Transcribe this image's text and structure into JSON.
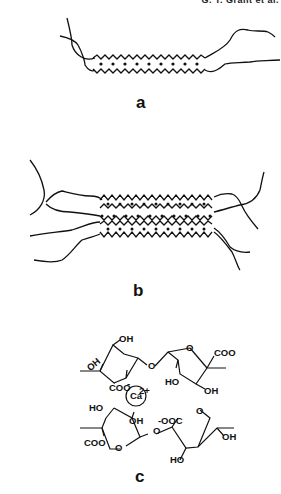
{
  "header": {
    "text": "G. T. Grant et al."
  },
  "figure": {
    "panels": [
      {
        "id": "a",
        "label": "a",
        "description": "Single chain dimer junction zone: two polymer strands associate into a zigzag egg-box with 9 cation sites"
      },
      {
        "id": "b",
        "label": "b",
        "description": "Aggregated egg-box junction zone with multiple strands and 3 rows of cation sites"
      },
      {
        "id": "c",
        "label": "c",
        "description": "Egg-box model: two guluronate chains chelating a calcium ion"
      }
    ],
    "chem_labels": {
      "top_oh1": "OH",
      "top_oh2": "OH",
      "top_coo_minus": "COO",
      "top_ho": "HO",
      "top_coo": "COO",
      "top_oh3": "OH",
      "calcium": "Ca",
      "calcium_charge": "2+",
      "bottom_ho1": "HO",
      "bottom_oh1": "OH",
      "bottom_ooc": "OOC",
      "bottom_coo": "COO",
      "bottom_ho2": "HO",
      "bottom_oh2": "OH",
      "ring_o": "O",
      "minus": "-"
    }
  }
}
